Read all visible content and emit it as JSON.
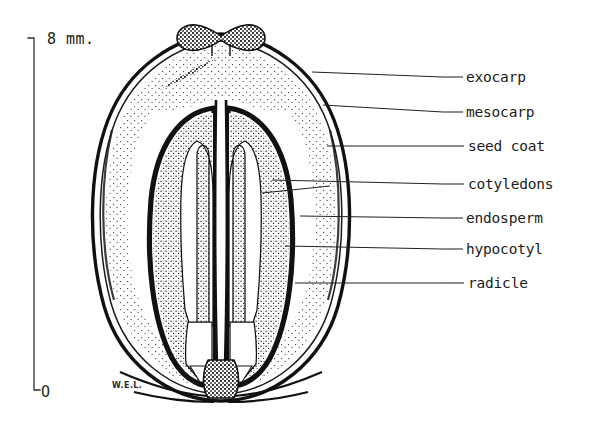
{
  "figure": {
    "background_color": "#ffffff",
    "ink_color": "#111111"
  },
  "scale": {
    "top_label": "8 mm.",
    "bottom_label": "O",
    "orientation": "vertical",
    "axis_x": 34,
    "top_y": 38,
    "bottom_y": 390
  },
  "signature": {
    "text": "W.E.L."
  },
  "labels": [
    {
      "id": "exocarp",
      "text": "exocarp",
      "text_x": 466,
      "text_y": 82,
      "dash_x1": 443,
      "dash_x2": 463,
      "leader_x": 443,
      "leader_y": 77,
      "target_x": 312,
      "target_y": 72
    },
    {
      "id": "mesocarp",
      "text": "mesocarp",
      "text_x": 466,
      "text_y": 117,
      "dash_x1": 443,
      "dash_x2": 463,
      "leader_x": 443,
      "leader_y": 112,
      "target_x": 323,
      "target_y": 105
    },
    {
      "id": "seedcoat",
      "text": "seed coat",
      "text_x": 468,
      "text_y": 151,
      "dash_x1": 443,
      "dash_x2": 464,
      "leader_x": 443,
      "leader_y": 146,
      "target_x": 327,
      "target_y": 146
    },
    {
      "id": "cotyledons",
      "text": "cotyledons",
      "text_x": 468,
      "text_y": 189,
      "dash_x1": 443,
      "dash_x2": 464,
      "leader_x": 443,
      "leader_y": 184,
      "target_x": 272,
      "target_y": 180
    },
    {
      "id": "endosperm",
      "text": "endosperm",
      "text_x": 466,
      "text_y": 223,
      "dash_x1": 443,
      "dash_x2": 463,
      "leader_x": 443,
      "leader_y": 218,
      "target_x": 300,
      "target_y": 216
    },
    {
      "id": "hypocotyl",
      "text": "hypocotyl",
      "text_x": 466,
      "text_y": 254,
      "dash_x1": 443,
      "dash_x2": 463,
      "leader_x": 443,
      "leader_y": 249,
      "target_x": 285,
      "target_y": 246
    },
    {
      "id": "radicle",
      "text": "radicle",
      "text_x": 468,
      "text_y": 288,
      "dash_x1": 443,
      "dash_x2": 464,
      "leader_x": 443,
      "leader_y": 283,
      "target_x": 295,
      "target_y": 283
    }
  ],
  "structures": {
    "apex_name": "persistent calyx remnant",
    "base_name": "stipe",
    "locule_count": 2
  }
}
